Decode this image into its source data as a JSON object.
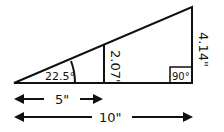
{
  "diagram": {
    "angle_label": "22.5°",
    "mid_height_label": "2.07\"",
    "right_angle_label": "90°",
    "full_height_label": "4.14\"",
    "half_base_label": "5\"",
    "full_base_label": "10\""
  }
}
